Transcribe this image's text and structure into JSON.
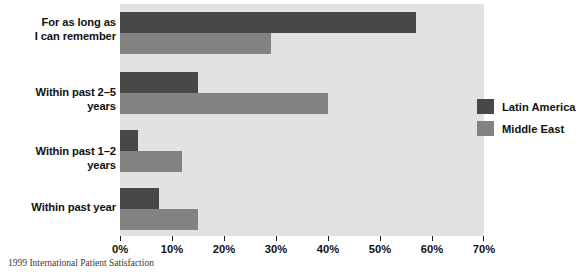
{
  "caption": "1999 International Patient Satisfaction",
  "legend": {
    "position": "inside-right",
    "items": [
      {
        "label": "Latin America",
        "color": "#484848",
        "swatch_name": "legend-swatch-latin-america"
      },
      {
        "label": "Middle East",
        "color": "#828282",
        "swatch_name": "legend-swatch-middle-east"
      }
    ]
  },
  "axis": {
    "tick_labels": [
      "0%",
      "10%",
      "20%",
      "30%",
      "40%",
      "50%",
      "60%",
      "70%"
    ],
    "tick_values": [
      0,
      10,
      20,
      30,
      40,
      50,
      60,
      70
    ],
    "min": 0,
    "max": 70
  },
  "categories": [
    {
      "lines": [
        "For as long as",
        "I can remember"
      ]
    },
    {
      "lines": [
        "Within past 2–5 years"
      ]
    },
    {
      "lines": [
        "Within past 1–2 years"
      ]
    },
    {
      "lines": [
        "Within past year"
      ]
    }
  ],
  "chart_data": {
    "type": "bar",
    "orientation": "horizontal",
    "title": "",
    "subtitle": "",
    "xlabel": "",
    "ylabel": "",
    "xlim": [
      0,
      70
    ],
    "grid": false,
    "legend_position": "inside-right",
    "categories": [
      "For as long as I can remember",
      "Within past 2–5 years",
      "Within past 1–2 years",
      "Within past year"
    ],
    "series": [
      {
        "name": "Latin America",
        "color": "#484848",
        "values": [
          57,
          15,
          3.5,
          7.5
        ]
      },
      {
        "name": "Middle East",
        "color": "#828282",
        "values": [
          29,
          40,
          12,
          15
        ]
      }
    ],
    "tick_labels": [
      "0%",
      "10%",
      "20%",
      "30%",
      "40%",
      "50%",
      "60%",
      "70%"
    ],
    "annotations": [
      "1999 International Patient Satisfaction"
    ]
  }
}
